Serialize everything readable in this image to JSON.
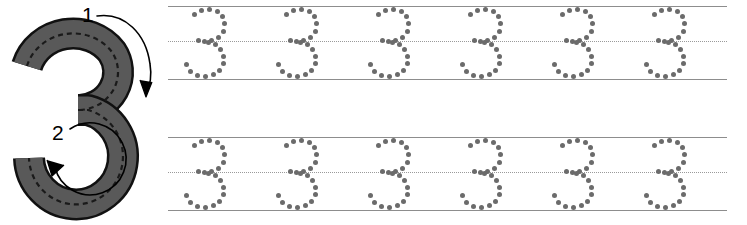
{
  "worksheet": {
    "title": "Number 3 Tracing Practice",
    "character": "3",
    "type": "handwriting-tracing-worksheet"
  },
  "demo": {
    "glyph": "3",
    "glyph_fill_color": "#595959",
    "glyph_outline_color": "#111111",
    "guide_dash_color": "#1a1a1a",
    "stroke_guides": [
      {
        "label": "1",
        "label_x": 82,
        "label_y": 22,
        "direction": "clockwise-down-right",
        "description": "Start at upper left, curve right and down to the middle"
      },
      {
        "label": "2",
        "label_x": 52,
        "label_y": 140,
        "direction": "counterclockwise-down-left",
        "description": "From the middle, curve right, down and back to the lower left"
      }
    ]
  },
  "practice": {
    "line_color": "#8d8d8d",
    "midline_color": "#9a9a9a",
    "dot_color": "#6b6b6b",
    "dot_size": 5,
    "glyph_spacing": 92,
    "glyph_start_x": 12,
    "rows": [
      {
        "row_index": 1,
        "top_line_y": 6,
        "mid_line_y": 41,
        "base_line_y": 79,
        "glyph_count": 6,
        "glyphs": [
          "3",
          "3",
          "3",
          "3",
          "3",
          "3"
        ]
      },
      {
        "row_index": 2,
        "top_line_y": 137,
        "mid_line_y": 172,
        "base_line_y": 210,
        "glyph_count": 6,
        "glyphs": [
          "3",
          "3",
          "3",
          "3",
          "3",
          "3"
        ]
      }
    ],
    "dot_pattern": [
      [
        14.5,
        8.0
      ],
      [
        21.5,
        4.0
      ],
      [
        29.5,
        3.0
      ],
      [
        37.0,
        5.0
      ],
      [
        42.5,
        10.0
      ],
      [
        44.5,
        17.5
      ],
      [
        43.0,
        25.0
      ],
      [
        38.5,
        31.0
      ],
      [
        31.5,
        34.5
      ],
      [
        24.5,
        35.0
      ],
      [
        18.0,
        34.0
      ],
      [
        28.0,
        36.5
      ],
      [
        35.0,
        38.5
      ],
      [
        40.5,
        43.0
      ],
      [
        43.5,
        50.0
      ],
      [
        43.0,
        57.5
      ],
      [
        39.5,
        64.0
      ],
      [
        33.0,
        68.5
      ],
      [
        25.0,
        70.5
      ],
      [
        17.0,
        69.0
      ],
      [
        10.5,
        65.0
      ],
      [
        6.0,
        58.5
      ]
    ]
  }
}
